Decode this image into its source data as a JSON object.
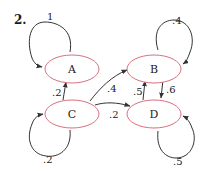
{
  "problem": {
    "number": "2."
  },
  "colors": {
    "node_stroke": "#d9707f",
    "edge": "#333333",
    "text": "#222222"
  },
  "nodes": [
    {
      "id": "A",
      "label": "A"
    },
    {
      "id": "B",
      "label": "B"
    },
    {
      "id": "C",
      "label": "C"
    },
    {
      "id": "D",
      "label": "D"
    }
  ],
  "edges": [
    {
      "from": "A",
      "to": "A",
      "label": "1"
    },
    {
      "from": "B",
      "to": "B",
      "label": ".4"
    },
    {
      "from": "C",
      "to": "C",
      "label": ".2"
    },
    {
      "from": "D",
      "to": "D",
      "label": ".5"
    },
    {
      "from": "C",
      "to": "A",
      "label": ".2"
    },
    {
      "from": "C",
      "to": "B",
      "label": ".4"
    },
    {
      "from": "C",
      "to": "D",
      "label": ".2"
    },
    {
      "from": "D",
      "to": "B",
      "label": ".5"
    },
    {
      "from": "B",
      "to": "D",
      "label": ".6"
    }
  ]
}
